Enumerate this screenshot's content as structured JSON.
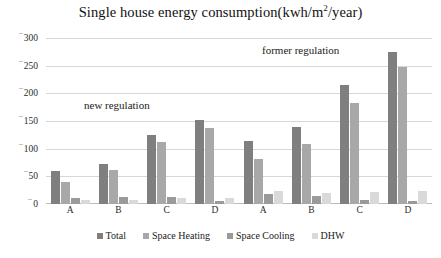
{
  "chart_data": {
    "type": "bar",
    "title_main": "Single house energy consumption(kwh/m",
    "title_sup": "2",
    "title_tail": "/year)",
    "xlabel": "",
    "ylabel": "",
    "ylim": [
      0,
      300
    ],
    "ytick_step": 50,
    "yticks": [
      300,
      250,
      200,
      150,
      100,
      50,
      0
    ],
    "grid": true,
    "legend_position": "bottom",
    "categories": [
      "A",
      "B",
      "C",
      "D",
      "A",
      "B",
      "C",
      "D"
    ],
    "series": [
      {
        "name": "Total",
        "color": "#7f7f7f",
        "values": [
          60,
          72,
          125,
          152,
          113,
          140,
          215,
          275
        ]
      },
      {
        "name": "Space Heating",
        "color": "#a8a8a8",
        "values": [
          40,
          62,
          112,
          137,
          82,
          108,
          183,
          248
        ]
      },
      {
        "name": "Space Cooling",
        "color": "#9a9a9a",
        "values": [
          10,
          12,
          12,
          5,
          18,
          15,
          8,
          5
        ]
      },
      {
        "name": "DHW",
        "color": "#d9d9d9",
        "values": [
          8,
          8,
          10,
          10,
          24,
          20,
          22,
          23
        ]
      }
    ],
    "annotations": [
      {
        "text": "new regulation",
        "name": "annotation-new-regulation"
      },
      {
        "text": "former regulation",
        "name": "annotation-former-regulation"
      }
    ]
  }
}
